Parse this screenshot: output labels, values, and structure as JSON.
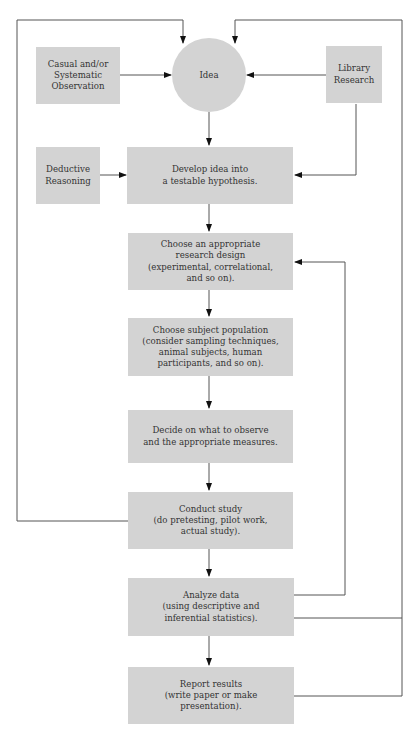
{
  "diagram": {
    "type": "flowchart",
    "nodes": {
      "observation": {
        "label": "Casual and/or\nSystematic\nObservation"
      },
      "idea": {
        "label": "Idea"
      },
      "library": {
        "label": "Library\nResearch"
      },
      "deductive": {
        "label": "Deductive\nReasoning"
      },
      "hypothesis": {
        "label": "Develop idea into\na testable hypothesis."
      },
      "design": {
        "label": "Choose an appropriate\nresearch design\n(experimental, correlational,\nand so on)."
      },
      "population": {
        "label": "Choose subject population\n(consider sampling techniques,\nanimal subjects, human\nparticipants, and so on)."
      },
      "measures": {
        "label": "Decide on what to observe\nand the appropriate measures."
      },
      "conduct": {
        "label": "Conduct study\n(do pretesting, pilot work,\nactual study)."
      },
      "analyze": {
        "label": "Analyze data\n(using descriptive and\ninferential statistics)."
      },
      "report": {
        "label": "Report results\n(write paper or make\npresentation)."
      }
    },
    "edges": [
      {
        "from": "observation",
        "to": "idea"
      },
      {
        "from": "library",
        "to": "idea"
      },
      {
        "from": "library",
        "to": "hypothesis"
      },
      {
        "from": "idea",
        "to": "hypothesis"
      },
      {
        "from": "deductive",
        "to": "hypothesis"
      },
      {
        "from": "hypothesis",
        "to": "design"
      },
      {
        "from": "design",
        "to": "population"
      },
      {
        "from": "population",
        "to": "measures"
      },
      {
        "from": "measures",
        "to": "conduct"
      },
      {
        "from": "conduct",
        "to": "analyze"
      },
      {
        "from": "analyze",
        "to": "report"
      },
      {
        "from": "conduct",
        "to": "idea",
        "kind": "feedback-loop-left"
      },
      {
        "from": "analyze",
        "to": "design",
        "kind": "feedback-loop-right-inner"
      },
      {
        "from": "analyze",
        "to": "idea",
        "kind": "feedback-loop-right-outer"
      },
      {
        "from": "report",
        "to": "idea",
        "kind": "feedback-loop-right-outer"
      }
    ],
    "colors": {
      "node_fill": "#d3d3d3",
      "line": "#555555",
      "text": "#333333"
    }
  }
}
